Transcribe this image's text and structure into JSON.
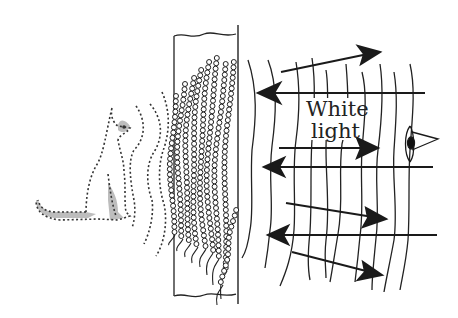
{
  "diagram": {
    "label": {
      "line1": "White",
      "line2": "light"
    },
    "colors": {
      "ink": "#1a1a1a",
      "dotted": "#333333",
      "shade": "#b8b8b8",
      "background": "#ffffff"
    },
    "elements": {
      "object": "cat-outline (dotted, object being recorded)",
      "object_waves": "dotted wavefronts travelling from cat toward plate",
      "plate": "holographic plate / emulsion slab",
      "fringes": "chains of beads (silver grains) forming curved interference fringes",
      "reconstruction_waves": "solid wavy wavefronts to the right of the plate",
      "arrows": "light rays: 3 incoming white-light rays (pointing left) and 4 reflected rays (pointing right)",
      "observer": "eye-icon on the right"
    }
  }
}
